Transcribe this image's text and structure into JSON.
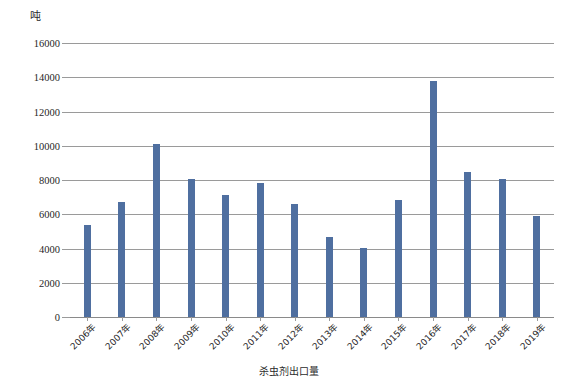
{
  "chart_data": {
    "type": "bar",
    "title": "",
    "subtitle": "",
    "unit_label": "吨",
    "xlabel": "",
    "ylabel": "",
    "categories": [
      "2006年",
      "2007年",
      "2008年",
      "2009年",
      "2010年",
      "2011年",
      "2012年",
      "2013年",
      "2014年",
      "2015年",
      "2016年",
      "2017年",
      "2018年",
      "2019年"
    ],
    "values": [
      5400,
      6700,
      10100,
      8050,
      7100,
      7850,
      6600,
      4700,
      4050,
      6850,
      13800,
      8450,
      8050,
      5900
    ],
    "series": [
      {
        "name": "杀虫剂出口量",
        "values": [
          5400,
          6700,
          10100,
          8050,
          7100,
          7850,
          6600,
          4700,
          4050,
          6850,
          13800,
          8450,
          8050,
          5900
        ]
      }
    ],
    "ylim": [
      0,
      16000
    ],
    "ytick_values": [
      0,
      2000,
      4000,
      6000,
      8000,
      10000,
      12000,
      14000,
      16000
    ],
    "ytick_labels": [
      "0",
      "2000",
      "4000",
      "6000",
      "8000",
      "10000",
      "12000",
      "14000",
      "16000"
    ],
    "grid": true,
    "grid_axis": "y",
    "legend": [
      "杀虫剂出口量"
    ],
    "legend_position": "bottom",
    "bar_color": "#4f6fa0",
    "grid_color": "#9a9a9a",
    "background_color": "#ffffff"
  },
  "legend": {
    "label": "杀虫剂出口量"
  }
}
